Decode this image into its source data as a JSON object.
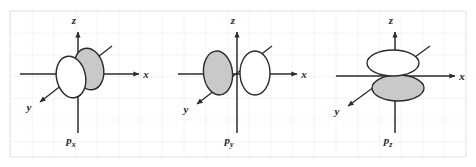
{
  "figure": {
    "width": 476,
    "height": 167,
    "background": "#ffffff",
    "grid": {
      "line_color": "#e8ebee",
      "major_line_color": "#dfe3e8",
      "cell_size": 21.7,
      "origin_x": 10,
      "origin_y": 11
    },
    "colors": {
      "axis": "#2b2b2b",
      "lobe_outline": "#2b2b2b",
      "lobe_fill_shaded": "#c9c9c9",
      "lobe_fill_unshaded": "#ffffff",
      "text": "#2a2a2a"
    }
  },
  "panels": [
    {
      "id": "px",
      "name": "p-x-orbital",
      "label": "p",
      "subscript": "x",
      "axes": [
        {
          "name": "z",
          "label": "z",
          "direction": "up"
        },
        {
          "name": "x",
          "label": "x",
          "direction": "right"
        },
        {
          "name": "y",
          "label": "y",
          "direction": "down-left"
        }
      ],
      "lobes": [
        {
          "name": "lobe-unshaded",
          "fill": "unshaded",
          "position": "left-of-z-axis",
          "orientation": "tilted"
        },
        {
          "name": "lobe-shaded",
          "fill": "shaded",
          "position": "right-of-z-axis",
          "orientation": "tilted"
        }
      ],
      "description": "Two overlapping tilted ellipses straddling the origin along the x axis"
    },
    {
      "id": "py",
      "name": "p-y-orbital",
      "label": "p",
      "subscript": "y",
      "axes": [
        {
          "name": "z",
          "label": "z",
          "direction": "up"
        },
        {
          "name": "x",
          "label": "x",
          "direction": "right"
        },
        {
          "name": "y",
          "label": "y",
          "direction": "down-left"
        }
      ],
      "lobes": [
        {
          "name": "lobe-shaded",
          "fill": "shaded",
          "position": "left-of-z-axis",
          "orientation": "upright"
        },
        {
          "name": "lobe-unshaded",
          "fill": "unshaded",
          "position": "right-of-z-axis",
          "orientation": "upright"
        }
      ],
      "description": "Two upright ellipses, shaded left and unshaded right, meeting at the origin"
    },
    {
      "id": "pz",
      "name": "p-z-orbital",
      "label": "p",
      "subscript": "z",
      "axes": [
        {
          "name": "z",
          "label": "z",
          "direction": "up"
        },
        {
          "name": "x",
          "label": "x",
          "direction": "right"
        },
        {
          "name": "y",
          "label": "y",
          "direction": "down-left"
        }
      ],
      "lobes": [
        {
          "name": "lobe-unshaded",
          "fill": "unshaded",
          "position": "above-origin",
          "orientation": "horizontal"
        },
        {
          "name": "lobe-shaded",
          "fill": "shaded",
          "position": "below-origin",
          "orientation": "horizontal"
        }
      ],
      "description": "Two flat horizontal ellipses stacked vertically, unshaded above and shaded below the origin"
    }
  ]
}
